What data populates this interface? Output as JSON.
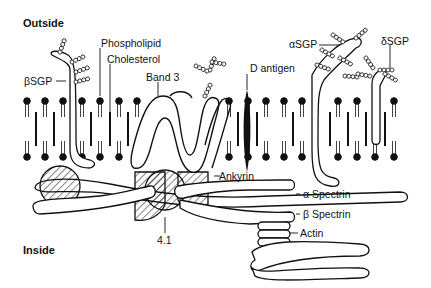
{
  "diagram": {
    "regions": {
      "outside": "Outside",
      "inside": "Inside"
    },
    "labels": {
      "beta_sgp": "βSGP",
      "phospholipid": "Phospholipid",
      "cholesterol": "Cholesterol",
      "band3": "Band 3",
      "d_antigen": "D antigen",
      "alpha_sgp": "αSGP",
      "delta_sgp": "δSGP",
      "ankyrin": "Ankyrin",
      "alpha_spectrin": "α Spectrin",
      "beta_spectrin": "β Spectrin",
      "actin": "Actin",
      "protein_4_1": "4.1"
    },
    "colors": {
      "ink": "#111111",
      "background": "#ffffff"
    }
  }
}
